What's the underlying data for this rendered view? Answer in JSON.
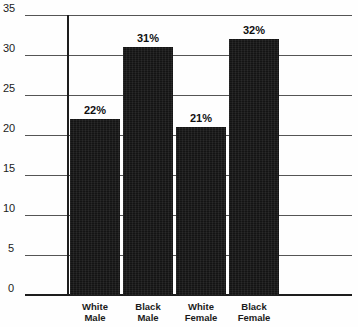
{
  "top_caption": "Percent",
  "chart_data": {
    "type": "bar",
    "title": "",
    "subtitle": "",
    "xlabel": "",
    "ylabel": "",
    "categories": [
      "White Male",
      "Black Male",
      "White Female",
      "Black Female"
    ],
    "category_lines": [
      [
        "White",
        "Male"
      ],
      [
        "Black",
        "Male"
      ],
      [
        "White",
        "Female"
      ],
      [
        "Black",
        "Female"
      ]
    ],
    "values": [
      22,
      31,
      21,
      32
    ],
    "data_labels": [
      "22%",
      "31%",
      "21%",
      "32%"
    ],
    "ylim": [
      0,
      35
    ],
    "ytick_values": [
      0,
      5,
      10,
      15,
      20,
      25,
      30,
      35
    ],
    "ytick_labels": [
      "0",
      "5",
      "10",
      "15",
      "20",
      "25",
      "30",
      "35"
    ],
    "grid": true,
    "legend": false,
    "bar_color": "#141414",
    "axis_color": "#1d1d1d",
    "grid_color": "#555555",
    "background_color": "#ffffff"
  }
}
